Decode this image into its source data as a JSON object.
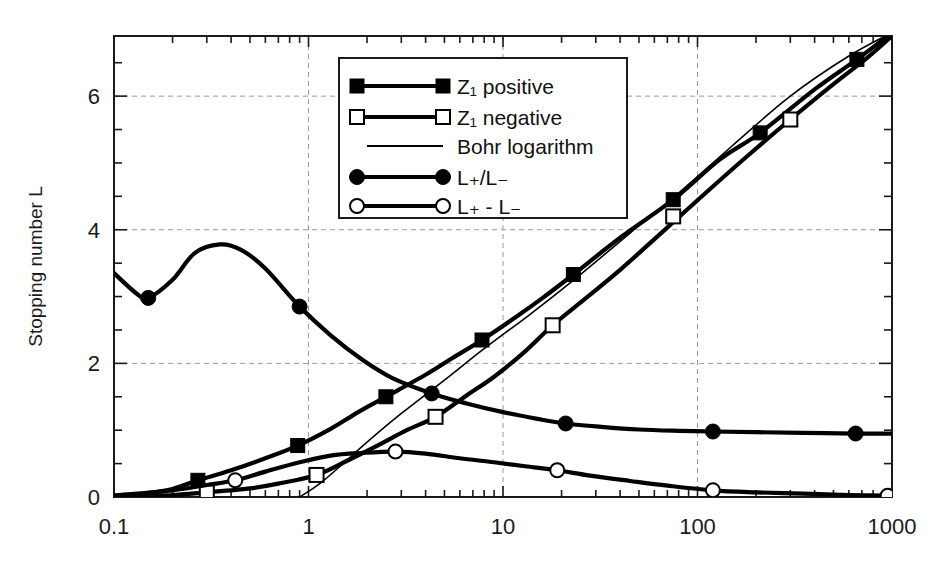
{
  "chart_data": {
    "type": "line",
    "title": "",
    "xlabel": "",
    "ylabel": "Stopping number L",
    "xscale": "log",
    "yscale": "linear",
    "xlim": [
      0.1,
      1000
    ],
    "ylim": [
      0,
      6.9
    ],
    "xticks": [
      "0.1",
      "1",
      "10",
      "100",
      "1000"
    ],
    "xtick_values": [
      0.1,
      1,
      10,
      100,
      1000
    ],
    "yticks": [
      "0",
      "2",
      "4",
      "6"
    ],
    "ytick_values": [
      0,
      2,
      4,
      6
    ],
    "yminor_step": 0.5,
    "grid": "dashed gridlines at major x and y ticks",
    "legend_position": "upper-center-left",
    "series": [
      {
        "name": "Z_1 positive",
        "label_main": "Z",
        "label_sub": "1",
        "label_tail": " positive",
        "marker": "filled-square",
        "line": "thick",
        "x": [
          0.1,
          0.15,
          0.2,
          0.27,
          0.4,
          0.6,
          0.88,
          1.3,
          1.8,
          2.5,
          4.0,
          5.5,
          7.8,
          12,
          16,
          23,
          40,
          75,
          130,
          210,
          400,
          660,
          1000
        ],
        "y": [
          0.02,
          0.06,
          0.12,
          0.25,
          0.4,
          0.58,
          0.77,
          1.02,
          1.27,
          1.5,
          1.83,
          2.08,
          2.35,
          2.72,
          2.98,
          3.33,
          3.88,
          4.45,
          5.05,
          5.45,
          6.1,
          6.55,
          6.95
        ],
        "marker_points": [
          {
            "x": 0.27,
            "y": 0.25
          },
          {
            "x": 0.88,
            "y": 0.77
          },
          {
            "x": 2.5,
            "y": 1.5
          },
          {
            "x": 7.8,
            "y": 2.35
          },
          {
            "x": 23,
            "y": 3.33
          },
          {
            "x": 75,
            "y": 4.45
          },
          {
            "x": 210,
            "y": 5.45
          },
          {
            "x": 660,
            "y": 6.55
          }
        ]
      },
      {
        "name": "Z_1 negative",
        "label_main": "Z",
        "label_sub": "1",
        "label_tail": " negative",
        "marker": "open-square",
        "line": "thick",
        "x": [
          0.1,
          0.2,
          0.3,
          0.5,
          0.7,
          1.1,
          1.6,
          2.3,
          3.2,
          4.5,
          6.5,
          9,
          13,
          18,
          26,
          40,
          65,
          110,
          180,
          300,
          500,
          750,
          1000
        ],
        "y": [
          0.0,
          0.03,
          0.07,
          0.13,
          0.2,
          0.33,
          0.55,
          0.78,
          1.0,
          1.2,
          1.52,
          1.8,
          2.18,
          2.57,
          2.95,
          3.4,
          3.95,
          4.55,
          5.1,
          5.65,
          6.18,
          6.58,
          6.9
        ],
        "marker_points": [
          {
            "x": 0.3,
            "y": 0.07
          },
          {
            "x": 1.1,
            "y": 0.33
          },
          {
            "x": 4.5,
            "y": 1.2
          },
          {
            "x": 18,
            "y": 2.57
          },
          {
            "x": 75,
            "y": 4.2
          },
          {
            "x": 300,
            "y": 5.65
          }
        ]
      },
      {
        "name": "Bohr logarithm",
        "label_main": "Bohr logarithm",
        "marker": "none",
        "line": "thin",
        "x": [
          0.9,
          1.2,
          2,
          3,
          5,
          8,
          14,
          25,
          45,
          80,
          150,
          300,
          600,
          1000
        ],
        "y": [
          0.0,
          0.25,
          0.82,
          1.25,
          1.75,
          2.22,
          2.75,
          3.33,
          3.95,
          4.55,
          5.25,
          6.0,
          6.6,
          6.95
        ],
        "marker_points": []
      },
      {
        "name": "L_+ / L_-",
        "label_main": "L",
        "label_sub_a": "+",
        "label_mid": "/L",
        "label_sub_b": "-",
        "marker": "filled-circle",
        "line": "thick",
        "x": [
          0.1,
          0.13,
          0.15,
          0.2,
          0.26,
          0.35,
          0.45,
          0.6,
          0.9,
          1.3,
          1.9,
          2.7,
          4.3,
          6.5,
          10,
          15,
          21,
          32,
          50,
          80,
          120,
          200,
          350,
          650,
          1000
        ],
        "y": [
          3.35,
          3.05,
          2.98,
          3.25,
          3.65,
          3.78,
          3.7,
          3.42,
          2.85,
          2.42,
          2.05,
          1.78,
          1.55,
          1.4,
          1.27,
          1.17,
          1.1,
          1.05,
          1.01,
          0.99,
          0.98,
          0.97,
          0.96,
          0.95,
          0.95
        ],
        "marker_points": [
          {
            "x": 0.15,
            "y": 2.98
          },
          {
            "x": 0.9,
            "y": 2.85
          },
          {
            "x": 4.3,
            "y": 1.55
          },
          {
            "x": 21,
            "y": 1.1
          },
          {
            "x": 120,
            "y": 0.98
          },
          {
            "x": 650,
            "y": 0.95
          }
        ]
      },
      {
        "name": "L_+ - L_-",
        "label_main": "L",
        "label_sub_a": "+",
        "label_mid": " - L",
        "label_sub_b": "-",
        "marker": "open-circle",
        "line": "thick",
        "x": [
          0.1,
          0.2,
          0.3,
          0.42,
          0.6,
          0.9,
          1.3,
          1.9,
          2.8,
          4.0,
          6.0,
          9,
          13,
          19,
          28,
          45,
          70,
          120,
          200,
          350,
          600,
          1000
        ],
        "y": [
          0.02,
          0.1,
          0.18,
          0.25,
          0.38,
          0.52,
          0.62,
          0.66,
          0.68,
          0.65,
          0.58,
          0.52,
          0.46,
          0.4,
          0.32,
          0.24,
          0.17,
          0.1,
          0.07,
          0.05,
          0.03,
          0.02
        ],
        "marker_points": [
          {
            "x": 0.42,
            "y": 0.25
          },
          {
            "x": 2.8,
            "y": 0.68
          },
          {
            "x": 19,
            "y": 0.4
          },
          {
            "x": 120,
            "y": 0.1
          },
          {
            "x": 950,
            "y": 0.02
          }
        ]
      }
    ]
  },
  "legend": {
    "items": [
      {
        "label": "Z₁ positive",
        "marker": "filled-square"
      },
      {
        "label": "Z₁ negative",
        "marker": "open-square"
      },
      {
        "label": "Bohr logarithm",
        "marker": "line-only"
      },
      {
        "label": "L₊/L₋",
        "marker": "filled-circle"
      },
      {
        "label": "L₊ - L₋",
        "marker": "open-circle"
      }
    ]
  }
}
